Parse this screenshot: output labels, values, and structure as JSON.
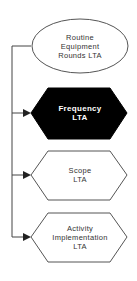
{
  "diagram": {
    "root": {
      "lines": [
        "Routine",
        "Equipment",
        "Rounds LTA"
      ],
      "shape": "ellipse",
      "fill": "#ffffff"
    },
    "children": [
      {
        "lines": [
          "Frequency",
          "LTA"
        ],
        "shape": "hexagon",
        "fill": "#000000",
        "highlighted": true
      },
      {
        "lines": [
          "Scope",
          "LTA"
        ],
        "shape": "hexagon",
        "fill": "#ffffff",
        "highlighted": false
      },
      {
        "lines": [
          "Activity",
          "Implementation",
          "LTA"
        ],
        "shape": "hexagon",
        "fill": "#ffffff",
        "highlighted": false
      }
    ],
    "colors": {
      "stroke": "#555555",
      "highlight_fill": "#000000",
      "text": "#333333"
    }
  }
}
